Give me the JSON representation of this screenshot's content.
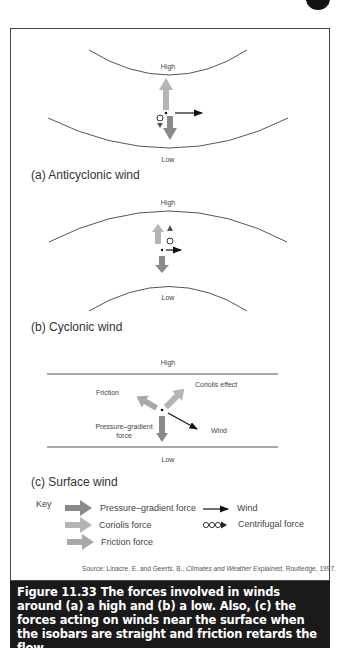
{
  "figure": {
    "number": "Figure 11.33",
    "caption": "The forces involved in winds around (a) a high and (b) a low. Also, (c) the forces acting on winds near the surface when the isobars are straight and friction retards the flow"
  },
  "panels": {
    "a": {
      "title": "(a) Anticyclonic wind",
      "top_label": "High",
      "bottom_label": "Low"
    },
    "b": {
      "title": "(b) Cyclonic wind",
      "top_label": "High",
      "bottom_label": "Low"
    },
    "c": {
      "title": "(c) Surface wind",
      "top_label": "High",
      "bottom_label": "Low",
      "labels": {
        "friction": "Friction",
        "coriolis": "Coriolis effect",
        "pressure_1": "Pressure–gradient",
        "pressure_2": "force",
        "wind": "Wind"
      }
    }
  },
  "key": {
    "title": "Key",
    "items": [
      {
        "label": "Pressure–gradient force",
        "symbol": "dark-gray-arrow",
        "color": "#8a8a8a"
      },
      {
        "label": "Coriolis force",
        "symbol": "light-gray-arrow",
        "color": "#b4b4b4"
      },
      {
        "label": "Friction force",
        "symbol": "medium-gray-arrow",
        "color": "#a8a8a8"
      },
      {
        "label": "Wind",
        "symbol": "thin-black-arrow",
        "color": "#111111"
      },
      {
        "label": "Centrifugal force",
        "symbol": "circles-arrow",
        "color": "#222222"
      }
    ]
  },
  "source": {
    "prefix": "Source: Linacre, E. and Geerts, B., ",
    "title": "Climates and Weather Explained",
    "suffix": ", Routledge, 1997."
  },
  "colors": {
    "pressure_gradient": "#8a8a8a",
    "coriolis": "#b4b4b4",
    "friction": "#a8a8a8",
    "caption_bg": "#1a1a1a",
    "isobar": "#555555"
  }
}
